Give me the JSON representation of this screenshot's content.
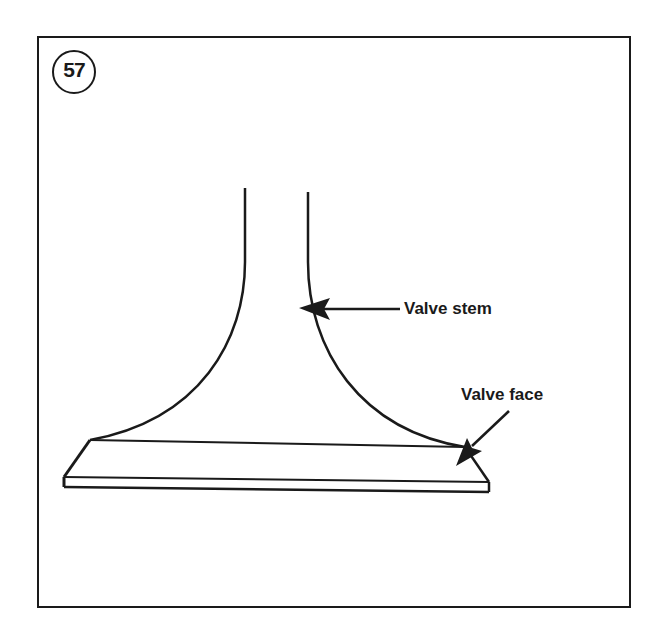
{
  "figure": {
    "number": "57",
    "labels": [
      {
        "id": "valve-stem",
        "text": "Valve stem"
      },
      {
        "id": "valve-face",
        "text": "Valve face"
      }
    ]
  },
  "colors": {
    "ink": "#1a1a1a",
    "background": "#ffffff"
  }
}
